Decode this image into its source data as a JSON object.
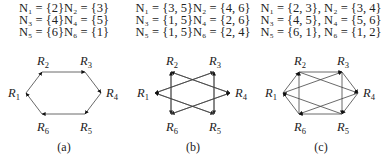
{
  "panels": [
    {
      "caption": "(a)",
      "sets": [
        [
          "N1 = {2}",
          "N2 = {3}"
        ],
        [
          "N3 = {4}",
          "N4 = {5}"
        ],
        [
          "N5 = {6}",
          "N6 = {1}"
        ]
      ],
      "sets_text": [
        "N₁ = {2}N₂ = {3}",
        "N₃ = {4}N₄ = {5}",
        "N₅ = {6}N₆ = {1}"
      ],
      "edges": [
        [
          1,
          2
        ],
        [
          2,
          3
        ],
        [
          3,
          4
        ],
        [
          4,
          5
        ],
        [
          5,
          6
        ],
        [
          6,
          1
        ]
      ]
    },
    {
      "caption": "(b)",
      "sets_text": [
        "N₁ = {3, 5}N₂ = {4, 6}",
        "N₃ = {1, 5}N₄ = {2, 6}",
        "N₅ = {1, 5}N₆ = {2, 4}"
      ],
      "edges": [
        [
          1,
          3
        ],
        [
          1,
          5
        ],
        [
          2,
          4
        ],
        [
          2,
          6
        ],
        [
          3,
          1
        ],
        [
          3,
          5
        ],
        [
          4,
          2
        ],
        [
          4,
          6
        ],
        [
          5,
          1
        ],
        [
          5,
          3
        ],
        [
          6,
          2
        ],
        [
          6,
          4
        ]
      ]
    },
    {
      "caption": "(c)",
      "sets_text": [
        "N₁ = {2, 3}, N₂ = {3, 4}",
        "N₃ = {4, 5}, N₄ = {5, 6}",
        "N₅ = {6, 1}, N₆ = {1, 2}"
      ],
      "edges": [
        [
          1,
          2
        ],
        [
          1,
          3
        ],
        [
          2,
          3
        ],
        [
          2,
          4
        ],
        [
          3,
          4
        ],
        [
          3,
          5
        ],
        [
          4,
          5
        ],
        [
          4,
          6
        ],
        [
          5,
          6
        ],
        [
          5,
          1
        ],
        [
          6,
          1
        ],
        [
          6,
          2
        ]
      ]
    }
  ],
  "nodes": [
    {
      "id": 1,
      "label": "R",
      "sub": "1"
    },
    {
      "id": 2,
      "label": "R",
      "sub": "2"
    },
    {
      "id": 3,
      "label": "R",
      "sub": "3"
    },
    {
      "id": 4,
      "label": "R",
      "sub": "4"
    },
    {
      "id": 5,
      "label": "R",
      "sub": "5"
    },
    {
      "id": 6,
      "label": "R",
      "sub": "6"
    }
  ],
  "colors": {
    "edge": "#444444",
    "text": "#222222"
  }
}
